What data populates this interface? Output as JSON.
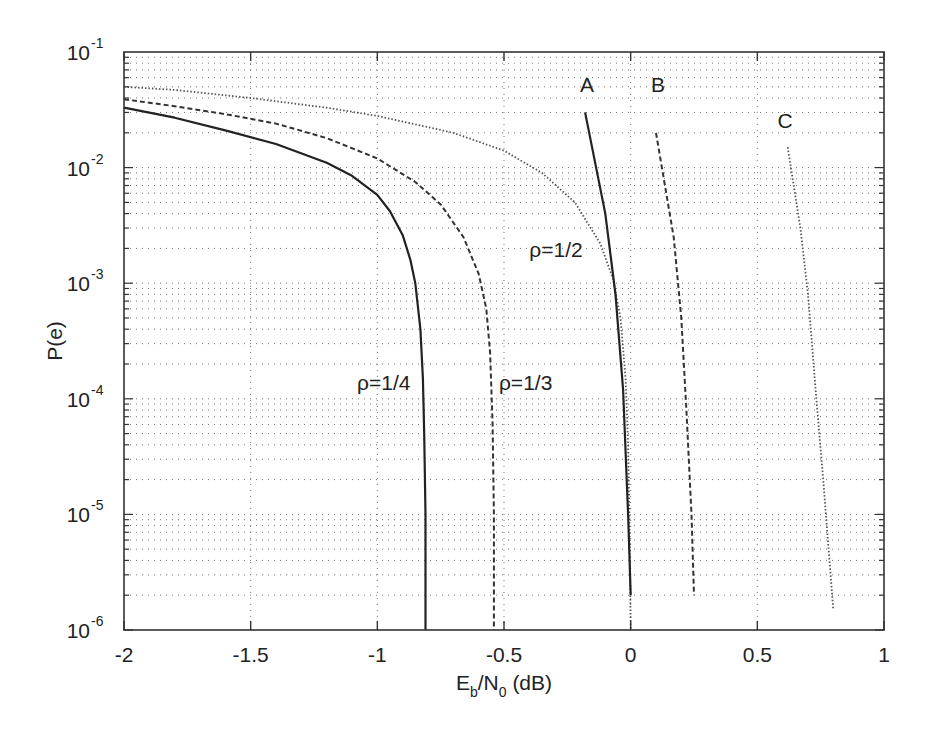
{
  "chart_data": {
    "type": "line",
    "title": "",
    "xlabel": "E_b/N_0 (dB)",
    "xlabel_parts": {
      "main1": "E",
      "sub1": "b",
      "main2": "/N",
      "sub2": "0",
      "tail": " (dB)"
    },
    "ylabel": "P(e)",
    "xlim": [
      -2,
      1
    ],
    "ylim": [
      1e-06,
      0.1
    ],
    "yscale": "log",
    "grid": true,
    "x_ticks": [
      -2,
      -1.5,
      -1,
      -0.5,
      0,
      0.5,
      1
    ],
    "x_tick_labels": [
      "-2",
      "-1.5",
      "-1",
      "-0.5",
      "0",
      "0.5",
      "1"
    ],
    "y_ticks": [
      1e-06,
      1e-05,
      0.0001,
      0.001,
      0.01,
      0.1
    ],
    "y_tick_labels": [
      {
        "base": "10",
        "exp": "-6"
      },
      {
        "base": "10",
        "exp": "-5"
      },
      {
        "base": "10",
        "exp": "-4"
      },
      {
        "base": "10",
        "exp": "-3"
      },
      {
        "base": "10",
        "exp": "-2"
      },
      {
        "base": "10",
        "exp": "-1"
      }
    ],
    "series": [
      {
        "name": "ρ=1/4",
        "style": "solid",
        "x": [
          -2.0,
          -1.8,
          -1.6,
          -1.4,
          -1.2,
          -1.1,
          -1.0,
          -0.95,
          -0.9,
          -0.87,
          -0.85,
          -0.83,
          -0.82,
          -0.815,
          -0.81,
          -0.81
        ],
        "y": [
          0.033,
          0.027,
          0.021,
          0.016,
          0.011,
          0.0085,
          0.0058,
          0.0042,
          0.0026,
          0.0016,
          0.001,
          0.0004,
          0.00015,
          5e-05,
          1e-05,
          1e-06
        ]
      },
      {
        "name": "ρ=1/3",
        "style": "dashed",
        "x": [
          -2.0,
          -1.8,
          -1.6,
          -1.4,
          -1.2,
          -1.0,
          -0.85,
          -0.75,
          -0.66,
          -0.6,
          -0.57,
          -0.555,
          -0.545,
          -0.54,
          -0.54
        ],
        "y": [
          0.039,
          0.034,
          0.029,
          0.024,
          0.018,
          0.012,
          0.0075,
          0.0048,
          0.0025,
          0.0012,
          0.0006,
          0.00025,
          6e-05,
          1e-05,
          1e-06
        ]
      },
      {
        "name": "ρ=1/2",
        "style": "dotted",
        "x": [
          -2.0,
          -1.8,
          -1.5,
          -1.2,
          -1.0,
          -0.7,
          -0.5,
          -0.35,
          -0.22,
          -0.12,
          -0.07,
          -0.04,
          -0.02,
          -0.01,
          -0.005,
          0.0
        ],
        "y": [
          0.05,
          0.047,
          0.04,
          0.033,
          0.028,
          0.02,
          0.014,
          0.009,
          0.005,
          0.0022,
          0.0011,
          0.0005,
          0.00015,
          4e-05,
          1e-05,
          1e-06
        ]
      },
      {
        "name": "A",
        "style": "solid",
        "x": [
          -0.18,
          -0.1,
          -0.06,
          -0.03,
          -0.01,
          0.0
        ],
        "y": [
          0.03,
          0.004,
          0.0008,
          0.00012,
          1e-05,
          2e-06
        ]
      },
      {
        "name": "B",
        "style": "dashed",
        "x": [
          0.1,
          0.17,
          0.2,
          0.22,
          0.24,
          0.25
        ],
        "y": [
          0.02,
          0.0025,
          0.0005,
          8e-05,
          1e-05,
          2e-06
        ]
      },
      {
        "name": "C",
        "style": "dotted",
        "x": [
          0.62,
          0.67,
          0.7,
          0.73,
          0.76,
          0.8
        ],
        "y": [
          0.015,
          0.003,
          0.0008,
          0.00012,
          2e-05,
          1.5e-06
        ]
      }
    ],
    "annotations": [
      {
        "text": "A",
        "x": -0.2,
        "y": 0.045
      },
      {
        "text": "B",
        "x": 0.08,
        "y": 0.045
      },
      {
        "text": "C",
        "x": 0.58,
        "y": 0.022
      },
      {
        "text": "ρ=1/2",
        "x": -0.4,
        "y": 0.0017
      },
      {
        "text": "ρ=1/3",
        "x": -0.52,
        "y": 0.00012
      },
      {
        "text": "ρ=1/4",
        "x": -1.08,
        "y": 0.00012
      }
    ]
  }
}
